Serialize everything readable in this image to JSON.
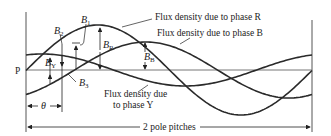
{
  "diagram": {
    "type": "three-phase flux density waveforms",
    "baseline_label": "P",
    "labels": {
      "phase_R": "Flux density due to phase R",
      "phase_B": "Flux density due to phase B",
      "phase_Y_line1": "Flux density due",
      "phase_Y_line2": "to phase Y",
      "pole_pitch": "2 pole pitches",
      "theta": "θ"
    },
    "symbols": {
      "B1": {
        "main": "B",
        "sub": "1"
      },
      "B2": {
        "main": "B",
        "sub": "2"
      },
      "B3": {
        "main": "B",
        "sub": "3"
      },
      "BR": {
        "main": "B",
        "sub": "R"
      },
      "BB": {
        "main": "B",
        "sub": "B"
      },
      "BY": {
        "main": "B",
        "sub": "Y"
      }
    },
    "curves": [
      {
        "name": "R",
        "amplitude_px": 45,
        "peak_x": 98
      },
      {
        "name": "B",
        "amplitude_px": 28,
        "peak_x": 146
      },
      {
        "name": "Y",
        "amplitude_px": 16,
        "peak_x": 42
      }
    ],
    "colors": {
      "line": "#2a2a2a",
      "axis": "#555555"
    }
  }
}
